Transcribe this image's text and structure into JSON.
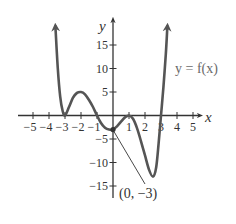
{
  "chart_data": {
    "type": "line",
    "title": "",
    "xlabel": "x",
    "ylabel": "y",
    "function_label": "y = f(x)",
    "xlim": [
      -5.5,
      5.5
    ],
    "ylim": [
      -18,
      20
    ],
    "x_ticks": [
      -5,
      -4,
      -3,
      -2,
      -1,
      1,
      2,
      3,
      4,
      5
    ],
    "x_tick_labels": [
      "−5",
      "−4",
      "−3",
      "−2",
      "−1",
      "1",
      "2",
      "3",
      "4",
      "5"
    ],
    "y_ticks": [
      -15,
      -10,
      -5,
      5,
      10,
      15
    ],
    "y_tick_labels": [
      "−15",
      "−10",
      "−5",
      "5",
      "10",
      "15"
    ],
    "grid": false,
    "series": [
      {
        "name": "y = f(x)",
        "points": [
          [
            -3.6,
            19
          ],
          [
            -3.45,
            10
          ],
          [
            -3.3,
            4
          ],
          [
            -3.15,
            1
          ],
          [
            -3,
            0
          ],
          [
            -2.75,
            1.8
          ],
          [
            -2.5,
            3.8
          ],
          [
            -2.25,
            4.8
          ],
          [
            -2,
            5
          ],
          [
            -1.75,
            4.5
          ],
          [
            -1.5,
            3.3
          ],
          [
            -1.25,
            1.8
          ],
          [
            -1,
            0
          ],
          [
            -0.75,
            -1.6
          ],
          [
            -0.5,
            -2.6
          ],
          [
            -0.25,
            -3
          ],
          [
            0,
            -3
          ],
          [
            0.25,
            -2.3
          ],
          [
            0.5,
            -1.3
          ],
          [
            0.75,
            -0.4
          ],
          [
            1,
            0
          ],
          [
            1.25,
            -0.7
          ],
          [
            1.5,
            -2.7
          ],
          [
            1.75,
            -5.5
          ],
          [
            2,
            -8.5
          ],
          [
            2.25,
            -11.5
          ],
          [
            2.5,
            -13
          ],
          [
            2.7,
            -11
          ],
          [
            2.85,
            -6
          ],
          [
            3,
            0
          ],
          [
            3.15,
            6
          ],
          [
            3.3,
            13
          ],
          [
            3.4,
            19
          ]
        ]
      }
    ],
    "annotations": [
      {
        "label": "(0, −3)",
        "point": [
          0,
          -3
        ]
      }
    ],
    "zeros": [
      -3,
      -1,
      1,
      3
    ]
  }
}
